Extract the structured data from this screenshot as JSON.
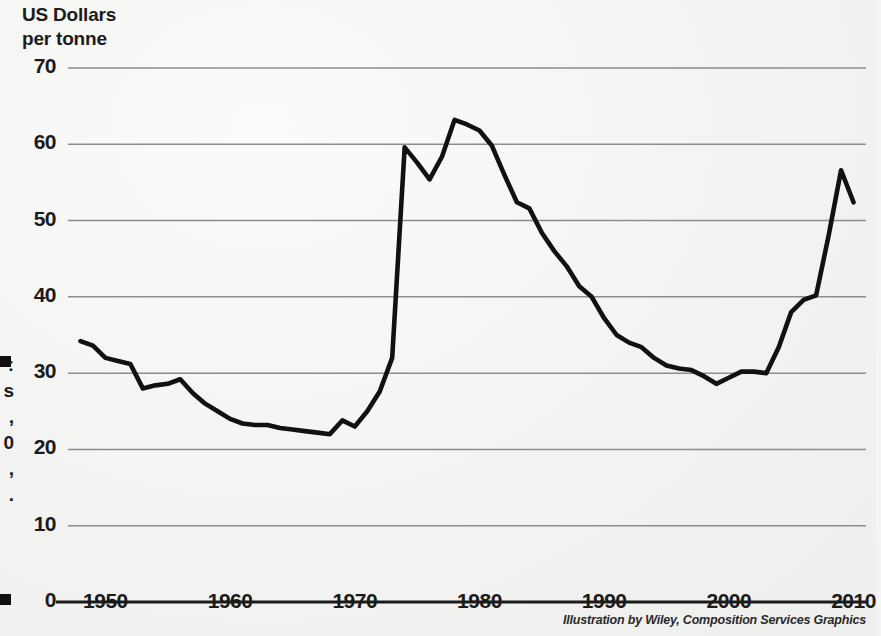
{
  "axis_title": {
    "line1": "US Dollars",
    "line2": "per tonne"
  },
  "credit": "Illustration by Wiley, Composition Services Graphics",
  "margin_caption_fragments": [
    ":",
    "s",
    ",",
    "0",
    ",",
    "."
  ],
  "chart_data": {
    "type": "line",
    "title": "",
    "subtitle": "",
    "xlabel": "",
    "ylabel": "US Dollars per tonne",
    "xlim": [
      1947,
      2011
    ],
    "ylim": [
      0,
      73
    ],
    "grid": true,
    "grid_axis": "y",
    "legend": "none",
    "line_color": "#111111",
    "grid_color": "#8d8d8d",
    "background_color": "#f4f4f2",
    "y_ticks": [
      0,
      10,
      20,
      30,
      40,
      50,
      60,
      70
    ],
    "y_tick_labels": [
      "0",
      "10",
      "20",
      "30",
      "40",
      "50",
      "60",
      "70"
    ],
    "x_ticks": [
      1950,
      1960,
      1970,
      1980,
      1990,
      2000,
      2010
    ],
    "x_tick_labels": [
      "1950",
      "1960",
      "1970",
      "1980",
      "1990",
      "2000",
      "2010"
    ],
    "series": [
      {
        "name": "Price",
        "x": [
          1948,
          1949,
          1950,
          1951,
          1952,
          1953,
          1954,
          1955,
          1956,
          1957,
          1958,
          1959,
          1960,
          1961,
          1962,
          1963,
          1964,
          1965,
          1966,
          1967,
          1968,
          1969,
          1970,
          1971,
          1972,
          1973,
          1974,
          1975,
          1976,
          1977,
          1978,
          1979,
          1980,
          1981,
          1982,
          1983,
          1984,
          1985,
          1986,
          1987,
          1988,
          1989,
          1990,
          1991,
          1992,
          1993,
          1994,
          1995,
          1996,
          1997,
          1998,
          1999,
          2000,
          2001,
          2002,
          2003,
          2004,
          2005,
          2006,
          2007,
          2008,
          2009,
          2010
        ],
        "y": [
          34.2,
          33.6,
          32.0,
          31.6,
          31.2,
          28.0,
          28.4,
          28.6,
          29.2,
          27.4,
          26.0,
          25.0,
          24.0,
          23.4,
          23.2,
          23.2,
          22.8,
          22.6,
          22.4,
          22.2,
          22.0,
          23.8,
          23.0,
          25.0,
          27.6,
          32.0,
          59.6,
          57.6,
          55.4,
          58.4,
          63.2,
          62.6,
          61.8,
          59.8,
          56.0,
          52.4,
          51.6,
          48.4,
          46.0,
          44.0,
          41.4,
          40.0,
          37.2,
          35.0,
          34.0,
          33.4,
          32.0,
          31.0,
          30.6,
          30.4,
          29.6,
          28.6,
          29.4,
          30.2,
          30.2,
          30.0,
          33.4,
          38.0,
          39.6,
          40.2,
          48.0,
          56.6,
          52.4
        ]
      }
    ]
  }
}
